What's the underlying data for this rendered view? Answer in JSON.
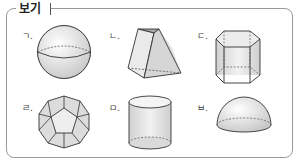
{
  "box": {
    "title": "보기",
    "items": [
      {
        "label": "ㄱ.",
        "shape": "sphere"
      },
      {
        "label": "ㄴ.",
        "shape": "truncated-pyramid"
      },
      {
        "label": "ㄷ.",
        "shape": "hexagonal-prism"
      },
      {
        "label": "ㄹ.",
        "shape": "dodecahedron"
      },
      {
        "label": "ㅁ.",
        "shape": "cylinder"
      },
      {
        "label": "ㅂ.",
        "shape": "hemisphere"
      }
    ]
  },
  "colors": {
    "border": "#9a9a9a",
    "shape_fill": "#e4e4e4",
    "shape_stroke": "#333333"
  }
}
